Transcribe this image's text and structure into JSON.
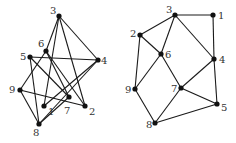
{
  "figure": {
    "background": "#ffffff",
    "edge_color": "#1a1a1a",
    "node_color": "#111111",
    "label_color": "#333333"
  },
  "graphs": [
    {
      "name": "left-graph",
      "nodes": [
        {
          "id": "1",
          "label": "1",
          "x": 44,
          "y": 106,
          "lx": 48,
          "ly": 115
        },
        {
          "id": "2",
          "label": "2",
          "x": 85,
          "y": 106,
          "lx": 89,
          "ly": 115
        },
        {
          "id": "3",
          "label": "3",
          "x": 59,
          "y": 16,
          "lx": 50,
          "ly": 14
        },
        {
          "id": "4",
          "label": "4",
          "x": 98,
          "y": 60,
          "lx": 101,
          "ly": 64
        },
        {
          "id": "5",
          "label": "5",
          "x": 30,
          "y": 57,
          "lx": 20,
          "ly": 60
        },
        {
          "id": "6",
          "label": "6",
          "x": 46,
          "y": 51,
          "lx": 38,
          "ly": 47
        },
        {
          "id": "7",
          "label": "7",
          "x": 69,
          "y": 97,
          "lx": 64,
          "ly": 114
        },
        {
          "id": "8",
          "label": "8",
          "x": 39,
          "y": 124,
          "lx": 33,
          "ly": 136
        },
        {
          "id": "9",
          "label": "9",
          "x": 20,
          "y": 90,
          "lx": 9,
          "ly": 93
        }
      ],
      "edges": [
        [
          "3",
          "6"
        ],
        [
          "3",
          "1"
        ],
        [
          "3",
          "4"
        ],
        [
          "3",
          "2"
        ],
        [
          "5",
          "4"
        ],
        [
          "5",
          "8"
        ],
        [
          "5",
          "7"
        ],
        [
          "6",
          "9"
        ],
        [
          "6",
          "7"
        ],
        [
          "6",
          "2"
        ],
        [
          "4",
          "1"
        ],
        [
          "4",
          "8"
        ],
        [
          "9",
          "2"
        ],
        [
          "9",
          "8"
        ],
        [
          "8",
          "7"
        ]
      ]
    },
    {
      "name": "right-graph",
      "nodes": [
        {
          "id": "1",
          "label": "1",
          "x": 213,
          "y": 15,
          "lx": 218,
          "ly": 19
        },
        {
          "id": "2",
          "label": "2",
          "x": 140,
          "y": 35,
          "lx": 130,
          "ly": 37
        },
        {
          "id": "3",
          "label": "3",
          "x": 175,
          "y": 15,
          "lx": 166,
          "ly": 13
        },
        {
          "id": "4",
          "label": "4",
          "x": 214,
          "y": 59,
          "lx": 219,
          "ly": 63
        },
        {
          "id": "5",
          "label": "5",
          "x": 217,
          "y": 104,
          "lx": 221,
          "ly": 111
        },
        {
          "id": "6",
          "label": "6",
          "x": 161,
          "y": 54,
          "lx": 165,
          "ly": 58
        },
        {
          "id": "7",
          "label": "7",
          "x": 181,
          "y": 88,
          "lx": 171,
          "ly": 92
        },
        {
          "id": "8",
          "label": "8",
          "x": 155,
          "y": 123,
          "lx": 146,
          "ly": 128
        },
        {
          "id": "9",
          "label": "9",
          "x": 135,
          "y": 89,
          "lx": 125,
          "ly": 93
        }
      ],
      "edges": [
        [
          "3",
          "1"
        ],
        [
          "3",
          "2"
        ],
        [
          "3",
          "6"
        ],
        [
          "3",
          "4"
        ],
        [
          "1",
          "4"
        ],
        [
          "2",
          "6"
        ],
        [
          "2",
          "9"
        ],
        [
          "6",
          "9"
        ],
        [
          "6",
          "7"
        ],
        [
          "4",
          "7"
        ],
        [
          "4",
          "5"
        ],
        [
          "7",
          "5"
        ],
        [
          "7",
          "8"
        ],
        [
          "9",
          "8"
        ],
        [
          "8",
          "5"
        ]
      ]
    }
  ]
}
